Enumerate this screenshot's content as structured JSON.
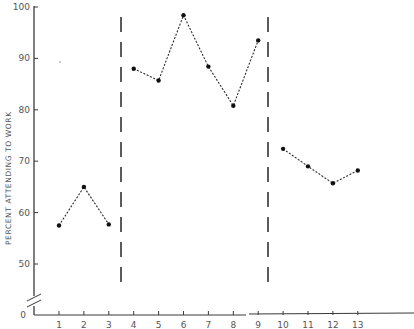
{
  "chart_data": {
    "type": "line",
    "title": "",
    "xlabel": "",
    "ylabel": "PERCENT ATTENDING TO WORK",
    "x": [
      1,
      2,
      3,
      4,
      5,
      6,
      7,
      8,
      9,
      10,
      11,
      12,
      13
    ],
    "x_tick_labels": [
      "1",
      "2",
      "3",
      "4",
      "5",
      "6",
      "7",
      "8",
      "9",
      "10",
      "11",
      "12",
      "13"
    ],
    "y_tick_labels": [
      "0",
      "50",
      "60",
      "70",
      "80",
      "90",
      "100"
    ],
    "ylim": [
      0,
      100
    ],
    "y_axis_break": "between 0 and 50",
    "grid": false,
    "legend": null,
    "phase_dividers_after_x": [
      3.5,
      9.5
    ],
    "series": [
      {
        "name": "Phase 1",
        "x": [
          1,
          2,
          3
        ],
        "values": [
          57.5,
          65,
          57.7
        ]
      },
      {
        "name": "Phase 2",
        "x": [
          4,
          5,
          6,
          7,
          8,
          9
        ],
        "values": [
          88,
          85.7,
          98.4,
          88.4,
          80.8,
          93.5
        ]
      },
      {
        "name": "Phase 3",
        "x": [
          10,
          11,
          12,
          13
        ],
        "values": [
          72.4,
          69,
          65.7,
          68.2
        ]
      }
    ],
    "style": {
      "line": "dotted",
      "marker": "filled-circle",
      "color": "#222222"
    }
  }
}
